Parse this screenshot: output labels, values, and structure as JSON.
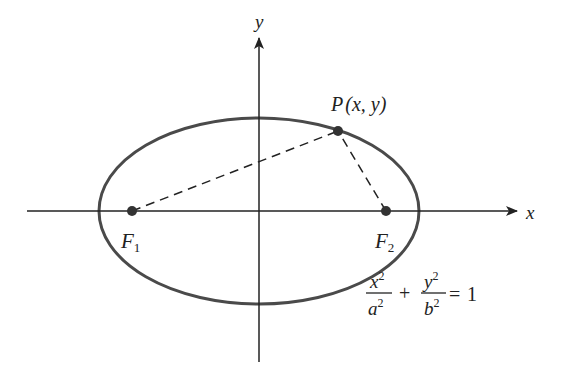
{
  "diagram": {
    "axes": {
      "x_label": "x",
      "y_label": "y"
    },
    "foci": [
      {
        "name": "F",
        "subscript": "1"
      },
      {
        "name": "F",
        "subscript": "2"
      }
    ],
    "point": {
      "label": "P(x, y)",
      "name": "P",
      "coords": "(x, y)"
    },
    "equation": {
      "term1_num": "x",
      "term1_den": "a",
      "term2_num": "y",
      "term2_den": "b",
      "exponent": "2",
      "plus": "+",
      "equals": "=",
      "rhs": "1"
    },
    "colors": {
      "ellipse": "#4a4a4a",
      "axes": "#222222",
      "dashed": "#222222",
      "points": "#333333"
    }
  }
}
